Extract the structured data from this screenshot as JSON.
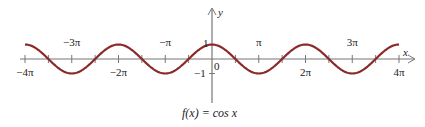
{
  "chart_data": {
    "type": "line",
    "title": "f(x) = cos x",
    "xlabel": "x",
    "ylabel": "y",
    "xlim": [
      -12.566,
      12.566
    ],
    "ylim": [
      -1,
      1
    ],
    "grid": false,
    "legend": null,
    "function": "cos(x)",
    "x_ticks": [
      {
        "value": -12.566,
        "label": "−4π",
        "pos": "below"
      },
      {
        "value": -9.425,
        "label": "−3π",
        "pos": "above"
      },
      {
        "value": -6.283,
        "label": "−2π",
        "pos": "below"
      },
      {
        "value": -3.142,
        "label": "−π",
        "pos": "above"
      },
      {
        "value": 3.142,
        "label": "π",
        "pos": "above"
      },
      {
        "value": 6.283,
        "label": "2π",
        "pos": "below"
      },
      {
        "value": 9.425,
        "label": "3π",
        "pos": "above"
      },
      {
        "value": 12.566,
        "label": "4π",
        "pos": "below"
      }
    ],
    "minor_x_ticks_step": 1.5708,
    "y_ticks": [
      {
        "value": 1,
        "label": "1"
      },
      {
        "value": -1,
        "label": "−1"
      }
    ],
    "origin_label": "0",
    "series": [
      {
        "name": "cos x",
        "color": "#8b2a2a",
        "x": [
          -12.566,
          -10.996,
          -9.425,
          -7.854,
          -6.283,
          -4.712,
          -3.142,
          -1.571,
          0,
          1.571,
          3.142,
          4.712,
          6.283,
          7.854,
          9.425,
          10.996,
          12.566
        ],
        "values": [
          1,
          0,
          -1,
          0,
          1,
          0,
          -1,
          0,
          1,
          0,
          -1,
          0,
          1,
          0,
          -1,
          0,
          1
        ]
      }
    ]
  },
  "labels": {
    "x_axis": "x",
    "y_axis": "y",
    "caption": "f(x) = cos x",
    "origin": "0",
    "y_one": "1",
    "y_neg_one": "−1"
  },
  "colors": {
    "curve": "#8b2a2a",
    "axis": "#777777"
  }
}
